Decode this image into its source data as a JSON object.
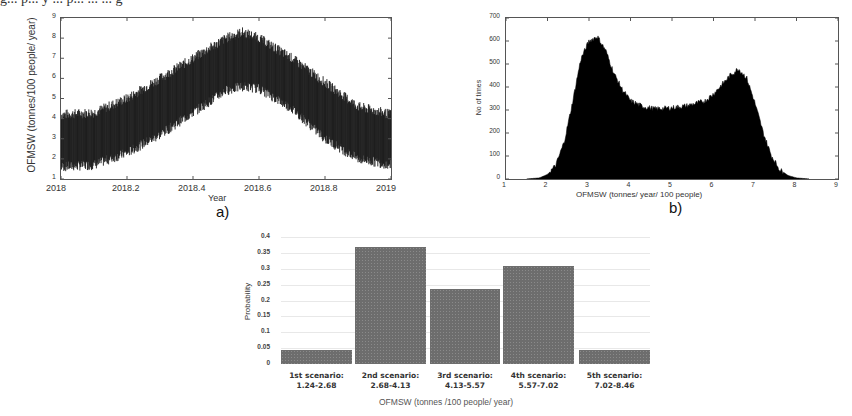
{
  "page": {
    "cropped_top_text": "g... p... y ... p... ... ... g"
  },
  "chart_data": [
    {
      "id": "a",
      "type": "line",
      "panel_label": "a)",
      "title": "",
      "xlabel": "Year",
      "ylabel": "OFMSW (tonnes/100 people/ year)",
      "xlim": [
        2018,
        2019
      ],
      "ylim": [
        1,
        9
      ],
      "x_ticks": [
        "2018",
        "2018.2",
        "2018.4",
        "2018.6",
        "2018.8",
        "2019"
      ],
      "y_ticks": [
        "1",
        "2",
        "3",
        "4",
        "5",
        "6",
        "7",
        "8",
        "9"
      ],
      "grid": false,
      "description": "Dense noisy daily series forming a band; band lower/upper envelope follows a seasonal hump peaking around mid-2018.55",
      "series": [
        {
          "name": "upper envelope",
          "x": [
            2018.0,
            2018.1,
            2018.2,
            2018.3,
            2018.4,
            2018.5,
            2018.55,
            2018.6,
            2018.7,
            2018.8,
            2018.9,
            2019.0
          ],
          "values": [
            4.2,
            4.3,
            5.0,
            6.0,
            7.0,
            8.0,
            8.3,
            8.0,
            7.0,
            5.8,
            4.6,
            4.2
          ]
        },
        {
          "name": "lower envelope",
          "x": [
            2018.0,
            2018.1,
            2018.2,
            2018.3,
            2018.4,
            2018.5,
            2018.55,
            2018.6,
            2018.7,
            2018.8,
            2018.9,
            2019.0
          ],
          "values": [
            1.6,
            1.7,
            2.3,
            3.2,
            4.3,
            5.4,
            5.6,
            5.5,
            4.5,
            3.0,
            2.0,
            1.7
          ]
        }
      ]
    },
    {
      "id": "b",
      "type": "bar",
      "subtype": "histogram",
      "panel_label": "b)",
      "title": "",
      "xlabel": "OFMSW (tonnes/ year/ 100 people)",
      "ylabel": "No of times",
      "xlim": [
        1,
        9
      ],
      "ylim": [
        0,
        700
      ],
      "x_ticks": [
        "1",
        "2",
        "3",
        "4",
        "5",
        "6",
        "7",
        "8",
        "9"
      ],
      "y_ticks": [
        "0",
        "100",
        "200",
        "300",
        "400",
        "500",
        "600",
        "700"
      ],
      "grid": false,
      "x": [
        1.5,
        1.8,
        2.0,
        2.2,
        2.4,
        2.6,
        2.8,
        3.0,
        3.2,
        3.4,
        3.6,
        3.8,
        4.0,
        4.3,
        4.6,
        5.0,
        5.4,
        5.8,
        6.0,
        6.2,
        6.4,
        6.6,
        6.8,
        7.0,
        7.2,
        7.4,
        7.6,
        7.8,
        8.0,
        8.3
      ],
      "values": [
        0,
        5,
        20,
        60,
        160,
        330,
        520,
        600,
        620,
        560,
        460,
        390,
        340,
        315,
        305,
        310,
        320,
        340,
        370,
        410,
        450,
        480,
        440,
        330,
        200,
        100,
        40,
        15,
        5,
        0
      ]
    },
    {
      "id": "c",
      "type": "bar",
      "title": "",
      "xlabel": "OFMSW (tonnes /100 people/ year)",
      "ylabel": "Probability",
      "ylim": [
        0,
        0.4
      ],
      "y_ticks": [
        "0",
        "0.05",
        "0.1",
        "0.15",
        "0.2",
        "0.25",
        "0.3",
        "0.35",
        "0.4"
      ],
      "grid": true,
      "categories": [
        "1st scenario: 1.24-2.68",
        "2nd scenario: 2.68-4.13",
        "3rd scenario: 4.13-5.57",
        "4th scenario: 5.57-7.02",
        "5th scenario: 7.02-8.46"
      ],
      "category_lines": [
        [
          "1st scenario:",
          "1.24-2.68"
        ],
        [
          "2nd scenario:",
          "2.68-4.13"
        ],
        [
          "3rd scenario:",
          "4.13-5.57"
        ],
        [
          "4th scenario:",
          "5.57-7.02"
        ],
        [
          "5th scenario:",
          "7.02-8.46"
        ]
      ],
      "values": [
        0.045,
        0.37,
        0.235,
        0.31,
        0.045
      ],
      "bar_color": "#6d6d6d"
    }
  ]
}
